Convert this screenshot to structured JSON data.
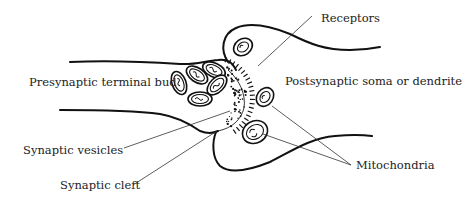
{
  "diagram": {
    "type": "synapse-illustration",
    "labels": {
      "receptors": "Receptors",
      "presynaptic": "Presynaptic terminal bud",
      "postsynaptic": "Postsynaptic soma or dendrite",
      "vesicles": "Synaptic vesicles",
      "cleft": "Synaptic cleft",
      "mitochondria": "Mitochondria"
    },
    "colors": {
      "ink": "#111111",
      "background": "#ffffff"
    }
  }
}
